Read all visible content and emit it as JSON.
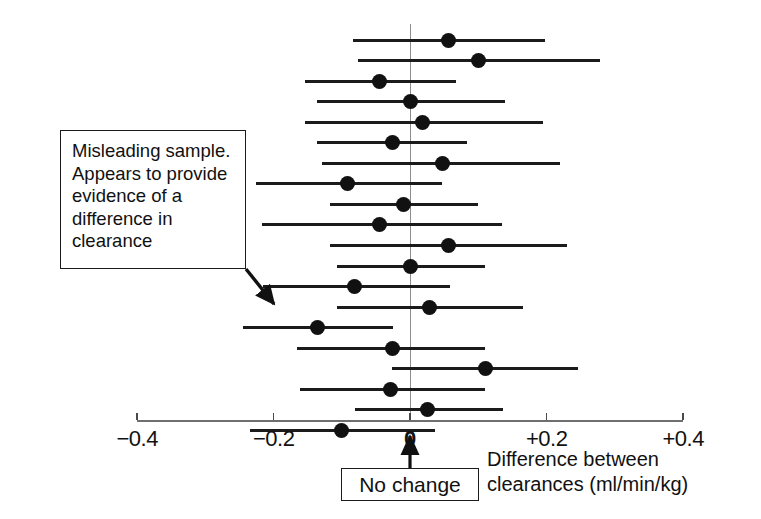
{
  "chart_data": {
    "type": "scatter",
    "plot_kind": "forest-plot-confidence-intervals",
    "title": "",
    "xlabel": "Difference between clearances (ml/min/kg)",
    "ylabel": "",
    "xlim": [
      -0.45,
      0.45
    ],
    "grid": false,
    "legend": null,
    "reference_line": {
      "value": 0,
      "label": "No change"
    },
    "axis_ticks": [
      {
        "value": -0.4,
        "label": "−0.4"
      },
      {
        "value": -0.2,
        "label": "−0.2"
      },
      {
        "value": 0,
        "label": "0"
      },
      {
        "value": 0.2,
        "label": "+0.2"
      },
      {
        "value": 0.4,
        "label": "+0.4"
      }
    ],
    "series_name": "Sample mean difference with 95% confidence interval",
    "point_estimates": [
      0.056,
      0.1,
      -0.044,
      0.0,
      0.019,
      -0.026,
      0.048,
      -0.091,
      -0.01,
      -0.044,
      0.057,
      0.0,
      -0.081,
      0.029,
      -0.135,
      -0.026,
      0.11,
      -0.029,
      0.026,
      -0.1
    ],
    "ci_lower": [
      -0.084,
      -0.076,
      -0.154,
      -0.136,
      -0.154,
      -0.136,
      -0.129,
      -0.226,
      -0.117,
      -0.217,
      -0.117,
      -0.107,
      -0.215,
      -0.107,
      -0.245,
      -0.166,
      -0.026,
      -0.161,
      -0.081,
      -0.234
    ],
    "ci_upper": [
      0.198,
      0.278,
      0.067,
      0.139,
      0.195,
      0.084,
      0.22,
      0.047,
      0.1,
      0.135,
      0.23,
      0.11,
      0.059,
      0.166,
      -0.025,
      0.11,
      0.246,
      0.11,
      0.136,
      0.037
    ],
    "points": [
      {
        "index": 1,
        "estimate": 0.056,
        "ci_low": -0.084,
        "ci_high": 0.198,
        "crosses_zero": true
      },
      {
        "index": 2,
        "estimate": 0.1,
        "ci_low": -0.076,
        "ci_high": 0.278,
        "crosses_zero": true
      },
      {
        "index": 3,
        "estimate": -0.044,
        "ci_low": -0.154,
        "ci_high": 0.067,
        "crosses_zero": true
      },
      {
        "index": 4,
        "estimate": 0.0,
        "ci_low": -0.136,
        "ci_high": 0.139,
        "crosses_zero": true
      },
      {
        "index": 5,
        "estimate": 0.019,
        "ci_low": -0.154,
        "ci_high": 0.195,
        "crosses_zero": true
      },
      {
        "index": 6,
        "estimate": -0.026,
        "ci_low": -0.136,
        "ci_high": 0.084,
        "crosses_zero": true
      },
      {
        "index": 7,
        "estimate": 0.048,
        "ci_low": -0.129,
        "ci_high": 0.22,
        "crosses_zero": true
      },
      {
        "index": 8,
        "estimate": -0.091,
        "ci_low": -0.226,
        "ci_high": 0.047,
        "crosses_zero": true
      },
      {
        "index": 9,
        "estimate": -0.01,
        "ci_low": -0.117,
        "ci_high": 0.1,
        "crosses_zero": true
      },
      {
        "index": 10,
        "estimate": -0.044,
        "ci_low": -0.217,
        "ci_high": 0.135,
        "crosses_zero": true
      },
      {
        "index": 11,
        "estimate": 0.057,
        "ci_low": -0.117,
        "ci_high": 0.23,
        "crosses_zero": true
      },
      {
        "index": 12,
        "estimate": 0.0,
        "ci_low": -0.107,
        "ci_high": 0.11,
        "crosses_zero": true
      },
      {
        "index": 13,
        "estimate": -0.081,
        "ci_low": -0.215,
        "ci_high": 0.059,
        "crosses_zero": true
      },
      {
        "index": 14,
        "estimate": 0.029,
        "ci_low": -0.107,
        "ci_high": 0.166,
        "crosses_zero": true
      },
      {
        "index": 15,
        "estimate": -0.135,
        "ci_low": -0.245,
        "ci_high": -0.025,
        "crosses_zero": false
      },
      {
        "index": 16,
        "estimate": -0.026,
        "ci_low": -0.166,
        "ci_high": 0.11,
        "crosses_zero": true
      },
      {
        "index": 17,
        "estimate": 0.11,
        "ci_low": -0.026,
        "ci_high": 0.246,
        "crosses_zero": true
      },
      {
        "index": 18,
        "estimate": -0.029,
        "ci_low": -0.161,
        "ci_high": 0.11,
        "crosses_zero": true
      },
      {
        "index": 19,
        "estimate": 0.026,
        "ci_low": -0.081,
        "ci_high": 0.136,
        "crosses_zero": true
      },
      {
        "index": 20,
        "estimate": -0.1,
        "ci_low": -0.234,
        "ci_high": 0.037,
        "crosses_zero": true
      }
    ],
    "annotations": [
      {
        "target_index": 15,
        "lines": [
          "Misleading sample.",
          "Appears to provide",
          "evidence of a",
          "difference in",
          "clearance"
        ]
      }
    ]
  },
  "colors": {
    "point": "#111111",
    "interval": "#1b1b1b",
    "reference_line": "#8d8d8d",
    "axis": "#6f6f6f",
    "text": "#111111",
    "background": "#ffffff"
  }
}
